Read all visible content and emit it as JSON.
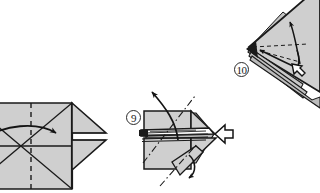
{
  "document": {
    "type": "origami-instruction-diagram",
    "title": "Origami folding steps 9 and 10",
    "background_color": "#ffffff",
    "paper_fill_color": "#cfcfcf",
    "paper_shadow_color": "#a8a8a8",
    "line_color": "#1a1a1a"
  },
  "steps": [
    {
      "id": "step-8-result",
      "number_label": "",
      "caption": "",
      "description": "Flattened square base seen from front with crossed diagonal creases, vertical dashed mountain crease and two triangular flaps on the right side; a curved solid arrow sweeps from left to the center.",
      "position": "left, partially cropped at image edge",
      "markings": [
        {
          "name": "diagonal-crease",
          "style": "solid",
          "count": 2
        },
        {
          "name": "vertical-center-crease",
          "style": "dashed",
          "count": 1
        },
        {
          "name": "horizontal-center-crease",
          "style": "solid",
          "count": 1
        },
        {
          "name": "fold-arrow",
          "style": "curved-solid-arrow",
          "direction": "left-to-center"
        }
      ]
    },
    {
      "id": "step-9",
      "number_label": "9",
      "caption": "",
      "description": "Preliminary-base shape with a horizontal open slit band across the middle, dash-dot valley lines crossing diagonally, a long solid arrow pointing up-left, a small curved arrow at the bottom right flap and a hollow push arrow entering from the right.",
      "position": "center",
      "markings": [
        {
          "name": "valley-fold-line",
          "style": "dash-dot",
          "count": 2
        },
        {
          "name": "unfold-arrow",
          "style": "solid-arrow",
          "direction": "up-left"
        },
        {
          "name": "flap-fold-arrow",
          "style": "curved-solid-arrow",
          "direction": "down"
        },
        {
          "name": "push-arrow",
          "style": "hollow-arrow",
          "direction": "left"
        },
        {
          "name": "layer-slit",
          "style": "open-edge-band",
          "count": 1
        }
      ]
    },
    {
      "id": "step-10",
      "number_label": "10",
      "caption": "",
      "description": "Rotated multi-layer kite shape pointing left, with dashed guide lines radiating from the left point, two thin solid arrows pointing toward the upper right and a small hollow push arrow at the lower right.",
      "position": "upper right",
      "markings": [
        {
          "name": "guide-line",
          "style": "dashed",
          "count": 2
        },
        {
          "name": "fold-arrow",
          "style": "solid-arrow",
          "direction": "up-right",
          "count": 2
        },
        {
          "name": "push-arrow",
          "style": "hollow-arrow",
          "direction": "down-left"
        },
        {
          "name": "layer-edge",
          "style": "solid",
          "count": 4
        }
      ]
    }
  ],
  "labels": {
    "step_9": "9",
    "step_10": "10"
  }
}
